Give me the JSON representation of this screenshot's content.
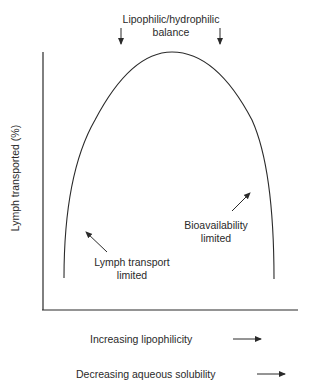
{
  "title": {
    "line1": "Lipophilic/hydrophilic",
    "line2": "balance"
  },
  "axes": {
    "y_label": "Lymph transported (%)",
    "x_label_1": "Increasing lipophilicity",
    "x_label_2": "Decreasing aqueous solubility"
  },
  "annotations": {
    "left_line1": "Lymph transport",
    "left_line2": "limited",
    "right_line1": "Bioavailability",
    "right_line2": "limited"
  },
  "colors": {
    "stroke": "#2a2a2a",
    "background": "#ffffff"
  }
}
